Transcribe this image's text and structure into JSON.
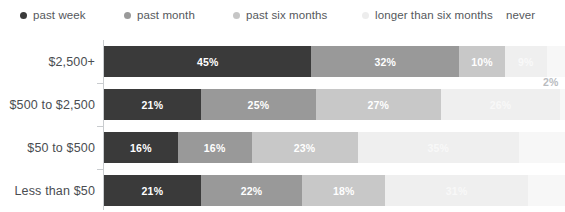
{
  "chart_data": {
    "type": "bar",
    "orientation": "horizontal",
    "stacked": true,
    "title": "",
    "subtitle": "",
    "xlabel": "",
    "ylabel": "",
    "xlim": [
      0,
      100
    ],
    "grid": false,
    "legend_position": "top",
    "categories": [
      "$2,500+",
      "$500 to $2,500",
      "$50 to $500",
      "Less than $50"
    ],
    "series": [
      {
        "name": "past week",
        "color": "#3a3a3a",
        "values": [
          45,
          21,
          16,
          21
        ]
      },
      {
        "name": "past month",
        "color": "#999999",
        "values": [
          32,
          25,
          16,
          22
        ]
      },
      {
        "name": "past six months",
        "color": "#c8c8c8",
        "values": [
          10,
          27,
          23,
          18
        ]
      },
      {
        "name": "longer than six months",
        "color": "#efefef",
        "values": [
          9,
          26,
          35,
          31
        ]
      },
      {
        "name": "never",
        "color": "#f7f7f7",
        "values": [
          2,
          1,
          10,
          8
        ]
      }
    ],
    "annotations": [
      {
        "name": "never-callout-2pct",
        "text": "2%",
        "x": 543,
        "y": 76
      }
    ],
    "footnote": ""
  },
  "legend": {
    "items": [
      {
        "label": "past week",
        "color": "#3a3a3a",
        "left": 20,
        "swatch": true
      },
      {
        "label": "past month",
        "color": "#9a9a9a",
        "left": 124,
        "swatch": true
      },
      {
        "label": "past six months",
        "color": "#c6c6c6",
        "left": 233,
        "swatch": true
      },
      {
        "label": "longer than six months",
        "color": "#ededed",
        "left": 362,
        "swatch": true
      },
      {
        "label": "never",
        "color": "#ffffff",
        "left": 506,
        "swatch": false
      }
    ]
  },
  "rows": [
    {
      "category": "$2,500+",
      "top": 0,
      "segments": [
        {
          "label": "45%",
          "value": 45,
          "color": "#3a3a3a",
          "show_label": true,
          "text_color": "#ffffff"
        },
        {
          "label": "32%",
          "value": 32,
          "color": "#999999",
          "show_label": true,
          "text_color": "#ffffff"
        },
        {
          "label": "10%",
          "value": 10,
          "color": "#c8c8c8",
          "show_label": true,
          "text_color": "#ffffff"
        },
        {
          "label": "9%",
          "value": 9,
          "color": "#efefef",
          "show_label": true,
          "text_color": "#f9f9f9"
        },
        {
          "label": "2%",
          "value": 4,
          "color": "#f7f7f7",
          "show_label": false,
          "text_color": "#ffffff"
        }
      ]
    },
    {
      "category": "$500 to $2,500",
      "top": 43,
      "segments": [
        {
          "label": "21%",
          "value": 21,
          "color": "#3a3a3a",
          "show_label": true,
          "text_color": "#ffffff"
        },
        {
          "label": "25%",
          "value": 25,
          "color": "#999999",
          "show_label": true,
          "text_color": "#ffffff"
        },
        {
          "label": "27%",
          "value": 27,
          "color": "#c8c8c8",
          "show_label": true,
          "text_color": "#ffffff"
        },
        {
          "label": "26%",
          "value": 26,
          "color": "#efefef",
          "show_label": true,
          "text_color": "#f8f8f8"
        },
        {
          "label": "1%",
          "value": 1,
          "color": "#f7f7f7",
          "show_label": false,
          "text_color": "#ffffff"
        }
      ]
    },
    {
      "category": "$50 to $500",
      "top": 86,
      "segments": [
        {
          "label": "16%",
          "value": 16,
          "color": "#3a3a3a",
          "show_label": true,
          "text_color": "#ffffff"
        },
        {
          "label": "16%",
          "value": 16,
          "color": "#999999",
          "show_label": true,
          "text_color": "#ffffff"
        },
        {
          "label": "23%",
          "value": 23,
          "color": "#c8c8c8",
          "show_label": true,
          "text_color": "#ffffff"
        },
        {
          "label": "35%",
          "value": 35,
          "color": "#efefef",
          "show_label": true,
          "text_color": "#f8f8f8"
        },
        {
          "label": "10%",
          "value": 10,
          "color": "#f7f7f7",
          "show_label": false,
          "text_color": "#ffffff"
        }
      ]
    },
    {
      "category": "Less than $50",
      "top": 129,
      "segments": [
        {
          "label": "21%",
          "value": 21,
          "color": "#3a3a3a",
          "show_label": true,
          "text_color": "#ffffff"
        },
        {
          "label": "22%",
          "value": 22,
          "color": "#999999",
          "show_label": true,
          "text_color": "#ffffff"
        },
        {
          "label": "18%",
          "value": 18,
          "color": "#c8c8c8",
          "show_label": true,
          "text_color": "#ffffff"
        },
        {
          "label": "31%",
          "value": 31,
          "color": "#efefef",
          "show_label": true,
          "text_color": "#f8f8f8"
        },
        {
          "label": "8%",
          "value": 8,
          "color": "#f7f7f7",
          "show_label": false,
          "text_color": "#ffffff"
        }
      ]
    }
  ],
  "annotation": {
    "never_2pct": "2%"
  },
  "footnote": {
    "text": ""
  }
}
